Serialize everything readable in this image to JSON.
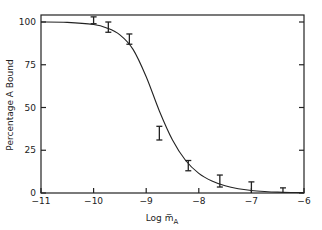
{
  "chart_data": {
    "type": "line",
    "title": "",
    "xlabel": "Log m̅",
    "xlabel_subscript": "A",
    "ylabel": "Percentage A Bound",
    "xlim": [
      -11,
      -6
    ],
    "ylim": [
      0,
      105
    ],
    "x_ticks": [
      "-11",
      "-10",
      "-9",
      "-8",
      "-7",
      "-6"
    ],
    "y_ticks": [
      "0",
      "25",
      "50",
      "75",
      "100"
    ],
    "grid": false,
    "legend": "none",
    "series": [
      {
        "name": "fitted curve",
        "kind": "line",
        "x": [
          -11,
          -10.5,
          -10,
          -9.75,
          -9.5,
          -9.25,
          -9,
          -8.75,
          -8.5,
          -8.25,
          -8,
          -7.75,
          -7.5,
          -7.25,
          -7,
          -6.75,
          -6.5,
          -6.25,
          -6
        ],
        "y": [
          100,
          99.8,
          98.5,
          96.5,
          92.5,
          84,
          68,
          48,
          31,
          19,
          11.5,
          7,
          4.2,
          2.5,
          1.5,
          0.9,
          0.5,
          0.3,
          0.2
        ]
      },
      {
        "name": "measured",
        "kind": "errorbar",
        "points": [
          {
            "x": -10.0,
            "y": 101,
            "err": 2
          },
          {
            "x": -9.72,
            "y": 97,
            "err": 3
          },
          {
            "x": -9.32,
            "y": 90,
            "err": 3
          },
          {
            "x": -8.75,
            "y": 35,
            "err": 4
          },
          {
            "x": -8.2,
            "y": 16,
            "err": 3
          },
          {
            "x": -7.6,
            "y": 7,
            "err": 3.5
          },
          {
            "x": -7.0,
            "y": 3,
            "err": 3.5
          },
          {
            "x": -6.4,
            "y": 1,
            "err": 2
          }
        ]
      }
    ]
  }
}
